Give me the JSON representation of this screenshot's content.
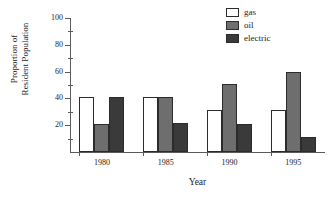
{
  "chart_data": {
    "type": "bar",
    "title": "",
    "xlabel": "Year",
    "ylabel": "Proportion of Resident Population",
    "ylabel_lines": [
      "Proportion of",
      "Resident Population"
    ],
    "categories": [
      "1980",
      "1985",
      "1990",
      "1995"
    ],
    "series": [
      {
        "name": "gas",
        "color": "#ffffff",
        "values": [
          41,
          41,
          31,
          31
        ]
      },
      {
        "name": "oil",
        "color": "#6e6e6e",
        "values": [
          21,
          41,
          51,
          60
        ]
      },
      {
        "name": "electric",
        "color": "#3a3a3a",
        "values": [
          41,
          22,
          21,
          11
        ]
      }
    ],
    "ylim": [
      0,
      100
    ],
    "ytick_labels": [
      "100",
      "80",
      "60",
      "40",
      "20"
    ],
    "ytick_values": [
      100,
      80,
      60,
      40,
      20
    ],
    "yminor_values": [
      90,
      70,
      50,
      30,
      10
    ],
    "grid": false,
    "legend_position": "top-right",
    "bar_edge_color": "#2b2b2b",
    "axis_color": "#5a5a5a"
  },
  "legend": {
    "items": [
      {
        "label": "gas"
      },
      {
        "label": "oil"
      },
      {
        "label": "electric"
      }
    ]
  }
}
